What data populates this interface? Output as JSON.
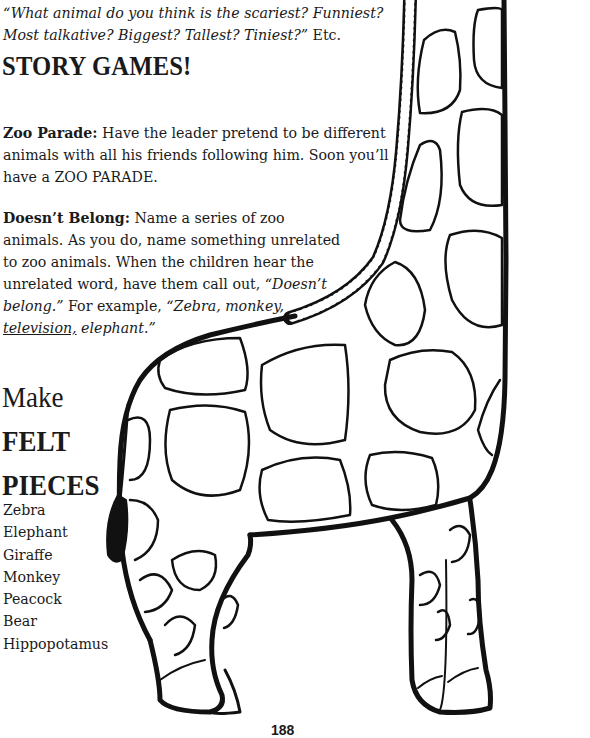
{
  "intro": {
    "quote_line1": "“What animal do you think is the scariest? Funniest?",
    "quote_line2": "Most talkative? Biggest? Tallest? Tiniest?”",
    "suffix": " Etc."
  },
  "story_games": {
    "heading": "STORY GAMES!",
    "zoo_parade": {
      "title": "Zoo Parade:",
      "text": " Have the leader pretend to be different animals with all his friends following him. Soon you’ll have a ZOO PARADE."
    },
    "doesnt_belong": {
      "title": "Doesn’t Belong:",
      "text": " Name a series of zoo animals. As you do, name something unrelated to zoo animals. When the children hear the unrelated word, have them call out, ",
      "callout": "“Doesn’t belong.”",
      "example_prefix": " For example, ",
      "example_a": "“Zebra, monkey, ",
      "example_underlined": "television,",
      "example_b": " elephant.”"
    }
  },
  "felt": {
    "heading_line1": "Make",
    "heading_line2": "FELT",
    "heading_line3": "PIECES",
    "items": [
      "Zebra",
      "Elephant",
      "Giraffe",
      "Monkey",
      "Peacock",
      "Bear",
      "Hippopotamus"
    ]
  },
  "illustration": {
    "subject": "giraffe-coloring-outline",
    "stroke_color": "#111111",
    "fill_color": "#ffffff"
  },
  "page_number": "188"
}
